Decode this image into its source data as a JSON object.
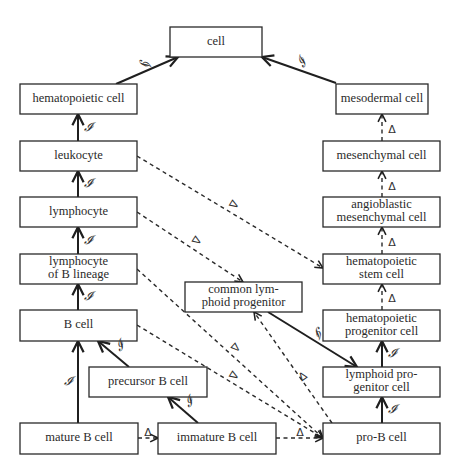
{
  "diagram": {
    "type": "ontology-graph",
    "nodes": [
      {
        "id": "cell",
        "label_lines": [
          "cell"
        ],
        "x": 170,
        "y": 27,
        "w": 92,
        "h": 30
      },
      {
        "id": "hematopoietic_cell",
        "label_lines": [
          "hematopoietic cell"
        ],
        "x": 20,
        "y": 84,
        "w": 117,
        "h": 30
      },
      {
        "id": "mesodermal_cell",
        "label_lines": [
          "mesodermal cell"
        ],
        "x": 336,
        "y": 84,
        "w": 92,
        "h": 30
      },
      {
        "id": "leukocyte",
        "label_lines": [
          "leukocyte"
        ],
        "x": 20,
        "y": 141,
        "w": 117,
        "h": 30
      },
      {
        "id": "mesenchymal_cell",
        "label_lines": [
          "mesenchymal cell"
        ],
        "x": 323,
        "y": 141,
        "w": 117,
        "h": 30
      },
      {
        "id": "lymphocyte",
        "label_lines": [
          "lymphocyte"
        ],
        "x": 20,
        "y": 197,
        "w": 117,
        "h": 30
      },
      {
        "id": "angioblastic_mesenchymal_cell",
        "label_lines": [
          "angioblastic",
          "mesenchymal cell"
        ],
        "x": 323,
        "y": 197,
        "w": 117,
        "h": 30
      },
      {
        "id": "lymphocyte_of_b_lineage",
        "label_lines": [
          "lymphocyte",
          "of B lineage"
        ],
        "x": 20,
        "y": 254,
        "w": 117,
        "h": 30
      },
      {
        "id": "hematopoietic_stem_cell",
        "label_lines": [
          "hematopoietic",
          "stem cell"
        ],
        "x": 323,
        "y": 254,
        "w": 117,
        "h": 30
      },
      {
        "id": "common_lymphoid_progenitor",
        "label_lines": [
          "common lym-",
          "phoid progenitor"
        ],
        "x": 185,
        "y": 282,
        "w": 117,
        "h": 30
      },
      {
        "id": "b_cell",
        "label_lines": [
          "B cell"
        ],
        "x": 20,
        "y": 310,
        "w": 117,
        "h": 31
      },
      {
        "id": "hematopoietic_progenitor_cell",
        "label_lines": [
          "hematopoietic",
          "progenitor cell"
        ],
        "x": 323,
        "y": 310,
        "w": 117,
        "h": 31
      },
      {
        "id": "precursor_b_cell",
        "label_lines": [
          "precursor B cell"
        ],
        "x": 89,
        "y": 367,
        "w": 118,
        "h": 30
      },
      {
        "id": "lymphoid_progenitor_cell",
        "label_lines": [
          "lymphoid pro-",
          "genitor cell"
        ],
        "x": 323,
        "y": 367,
        "w": 117,
        "h": 30
      },
      {
        "id": "mature_b_cell",
        "label_lines": [
          "mature B cell"
        ],
        "x": 20,
        "y": 423,
        "w": 118,
        "h": 31
      },
      {
        "id": "immature_b_cell",
        "label_lines": [
          "immature B cell"
        ],
        "x": 158,
        "y": 423,
        "w": 118,
        "h": 31
      },
      {
        "id": "pro_b_cell",
        "label_lines": [
          "pro-B cell"
        ],
        "x": 323,
        "y": 423,
        "w": 117,
        "h": 31
      }
    ],
    "edges": [
      {
        "from": "hematopoietic_cell",
        "to": "cell",
        "style": "solid",
        "label": "𝓘",
        "x1": 116,
        "y1": 84,
        "x2": 178,
        "y2": 57,
        "lx": 143,
        "ly": 63
      },
      {
        "from": "mesodermal_cell",
        "to": "cell",
        "style": "solid",
        "label": "𝓘",
        "x1": 336,
        "y1": 83,
        "x2": 262,
        "y2": 57,
        "lx": 303,
        "ly": 63
      },
      {
        "from": "mesenchymal_cell",
        "to": "mesodermal_cell",
        "style": "dashed",
        "label": "Δ",
        "x1": 382,
        "y1": 141,
        "x2": 382,
        "y2": 114,
        "lx": 392,
        "ly": 130
      },
      {
        "from": "angioblastic_mesenchymal_cell",
        "to": "mesenchymal_cell",
        "style": "dashed",
        "label": "Δ",
        "x1": 382,
        "y1": 197,
        "x2": 382,
        "y2": 171,
        "lx": 392,
        "ly": 187
      },
      {
        "from": "hematopoietic_stem_cell",
        "to": "angioblastic_mesenchymal_cell",
        "style": "dashed",
        "label": "Δ",
        "x1": 382,
        "y1": 254,
        "x2": 382,
        "y2": 227,
        "lx": 392,
        "ly": 243
      },
      {
        "from": "hematopoietic_progenitor_cell",
        "to": "hematopoietic_stem_cell",
        "style": "dashed",
        "label": "Δ",
        "x1": 382,
        "y1": 310,
        "x2": 382,
        "y2": 284,
        "lx": 392,
        "ly": 299
      },
      {
        "from": "leukocyte",
        "to": "hematopoietic_cell",
        "style": "solid",
        "label": "𝓘",
        "x1": 78,
        "y1": 141,
        "x2": 78,
        "y2": 114,
        "lx": 88,
        "ly": 128
      },
      {
        "from": "lymphocyte",
        "to": "leukocyte",
        "style": "solid",
        "label": "𝓘",
        "x1": 78,
        "y1": 197,
        "x2": 78,
        "y2": 171,
        "lx": 88,
        "ly": 184
      },
      {
        "from": "lymphocyte_of_b_lineage",
        "to": "lymphocyte",
        "style": "solid",
        "label": "𝓘",
        "x1": 78,
        "y1": 254,
        "x2": 78,
        "y2": 227,
        "lx": 88,
        "ly": 241
      },
      {
        "from": "b_cell",
        "to": "lymphocyte_of_b_lineage",
        "style": "solid",
        "label": "𝓘",
        "x1": 78,
        "y1": 310,
        "x2": 78,
        "y2": 284,
        "lx": 88,
        "ly": 297
      },
      {
        "from": "mature_b_cell",
        "to": "b_cell",
        "style": "solid",
        "label": "𝓘",
        "x1": 78,
        "y1": 423,
        "x2": 78,
        "y2": 341,
        "lx": 68,
        "ly": 382
      },
      {
        "from": "precursor_b_cell",
        "to": "b_cell",
        "style": "solid",
        "label": "𝓘",
        "x1": 129,
        "y1": 367,
        "x2": 98,
        "y2": 341,
        "lx": 120,
        "ly": 347
      },
      {
        "from": "immature_b_cell",
        "to": "precursor_b_cell",
        "style": "solid",
        "label": "𝓘",
        "x1": 198,
        "y1": 423,
        "x2": 168,
        "y2": 397,
        "lx": 190,
        "ly": 403
      },
      {
        "from": "lymphoid_progenitor_cell",
        "to": "hematopoietic_progenitor_cell",
        "style": "solid",
        "label": "𝓘",
        "x1": 382,
        "y1": 367,
        "x2": 382,
        "y2": 341,
        "lx": 392,
        "ly": 354
      },
      {
        "from": "pro_b_cell",
        "to": "lymphoid_progenitor_cell",
        "style": "solid",
        "label": "𝓘",
        "x1": 382,
        "y1": 423,
        "x2": 382,
        "y2": 397,
        "lx": 392,
        "ly": 410
      },
      {
        "from": "common_lymphoid_progenitor",
        "to": "lymphoid_progenitor_cell",
        "style": "solid",
        "label": "𝓘",
        "x1": 268,
        "y1": 312,
        "x2": 357,
        "y2": 367,
        "lx": 318,
        "ly": 331
      },
      {
        "from": "leukocyte",
        "to": "hematopoietic_stem_cell",
        "style": "dashed",
        "label": "Δ",
        "x1": 137,
        "y1": 156,
        "x2": 323,
        "y2": 268,
        "lx": 233,
        "ly": 204
      },
      {
        "from": "lymphocyte",
        "to": "common_lymphoid_progenitor",
        "style": "dashed",
        "label": "Δ",
        "x1": 137,
        "y1": 212,
        "x2": 243,
        "y2": 282,
        "lx": 196,
        "ly": 240
      },
      {
        "from": "lymphocyte_of_b_lineage",
        "to": "pro_b_cell",
        "style": "dashed",
        "label": "Δ",
        "x1": 137,
        "y1": 269,
        "x2": 323,
        "y2": 438,
        "lx": 235,
        "ly": 347
      },
      {
        "from": "b_cell",
        "to": "pro_b_cell",
        "style": "dashed",
        "label": "Δ",
        "x1": 137,
        "y1": 325,
        "x2": 323,
        "y2": 438,
        "lx": 233,
        "ly": 375
      },
      {
        "from": "lymphoid_progenitor_cell",
        "to": "common_lymphoid_progenitor",
        "style": "dashed",
        "label": "Δ",
        "x1": 332,
        "y1": 423,
        "x2": 254,
        "y2": 312,
        "lx": 303,
        "ly": 377
      },
      {
        "from": "mature_b_cell",
        "to": "immature_b_cell",
        "style": "dashed",
        "label": "Δ",
        "x1": 138,
        "y1": 438,
        "x2": 158,
        "y2": 438,
        "lx": 148,
        "ly": 433
      },
      {
        "from": "immature_b_cell",
        "to": "pro_b_cell",
        "style": "dashed",
        "label": "Δ",
        "x1": 276,
        "y1": 438,
        "x2": 323,
        "y2": 438,
        "lx": 300,
        "ly": 433
      }
    ],
    "legend": {
      "solid_edge_label": "𝓘",
      "dashed_edge_label": "Δ"
    }
  }
}
